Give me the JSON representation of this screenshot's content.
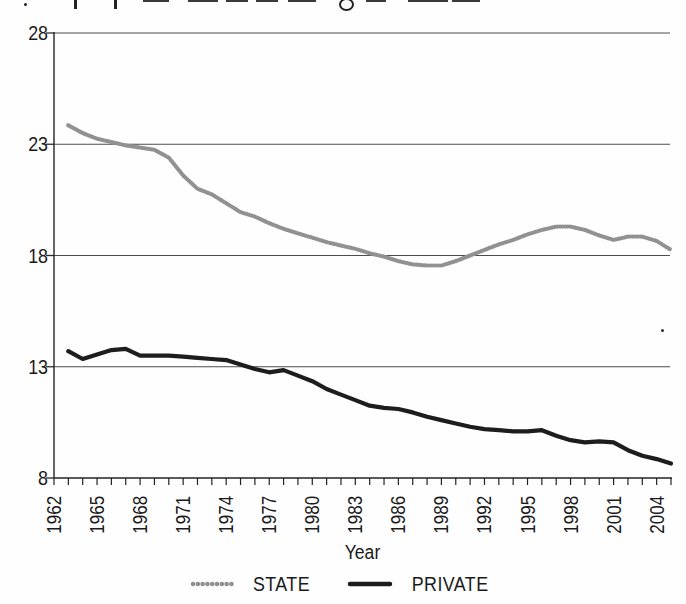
{
  "figure": {
    "background": "#fefefe",
    "cropped_caption_note": "top line of caption text is cut off by the crop; only letter bottoms/descenders are visible",
    "x_axis_title": "Year"
  },
  "scan_artifacts": {
    "cropped_text_fragments": [
      {
        "type": "dot",
        "x": 24,
        "w": 3
      },
      {
        "type": "stem",
        "x": 74,
        "w": 3
      },
      {
        "type": "stem",
        "x": 114,
        "w": 3
      },
      {
        "type": "dash",
        "x": 143,
        "w": 26
      },
      {
        "type": "dash",
        "x": 188,
        "w": 30
      },
      {
        "type": "dash",
        "x": 226,
        "w": 22
      },
      {
        "type": "dash",
        "x": 256,
        "w": 22
      },
      {
        "type": "dash",
        "x": 288,
        "w": 28
      },
      {
        "type": "loop",
        "x": 339,
        "w": 11
      },
      {
        "type": "dash",
        "x": 366,
        "w": 20
      },
      {
        "type": "dash",
        "x": 408,
        "w": 40
      },
      {
        "type": "dash",
        "x": 452,
        "w": 28
      }
    ],
    "speck": {
      "x": 661,
      "y": 329
    }
  },
  "chart_data": {
    "type": "line",
    "title": "",
    "xlabel": "Year",
    "ylabel": "",
    "xlim": [
      1962,
      2005
    ],
    "ylim": [
      8,
      28
    ],
    "y_ticks": [
      28,
      23,
      18,
      13,
      8
    ],
    "x_tick_every_year": true,
    "x_label_years": [
      1962,
      1965,
      1968,
      1971,
      1974,
      1977,
      1980,
      1983,
      1986,
      1989,
      1992,
      1995,
      1998,
      2001,
      2004
    ],
    "grid": "horizontal gridlines at 13, 18, 23, 28",
    "legend_position": "bottom-center",
    "x": [
      1963,
      1964,
      1965,
      1966,
      1967,
      1968,
      1969,
      1970,
      1971,
      1972,
      1973,
      1974,
      1975,
      1976,
      1977,
      1978,
      1979,
      1980,
      1981,
      1982,
      1983,
      1984,
      1985,
      1986,
      1987,
      1988,
      1989,
      1990,
      1991,
      1992,
      1993,
      1994,
      1995,
      1996,
      1997,
      1998,
      1999,
      2000,
      2001,
      2002,
      2003,
      2004,
      2005
    ],
    "series": [
      {
        "name": "STATE",
        "color": "#919191",
        "line_style": "thick beaded/dotted gray",
        "values": [
          23.85,
          23.5,
          23.25,
          23.1,
          22.95,
          22.85,
          22.75,
          22.4,
          21.6,
          21.0,
          20.75,
          20.35,
          19.95,
          19.75,
          19.45,
          19.2,
          19.0,
          18.8,
          18.6,
          18.45,
          18.3,
          18.1,
          17.95,
          17.75,
          17.6,
          17.55,
          17.55,
          17.75,
          18.0,
          18.25,
          18.5,
          18.7,
          18.95,
          19.15,
          19.3,
          19.3,
          19.15,
          18.9,
          18.7,
          18.85,
          18.85,
          18.65,
          18.25
        ]
      },
      {
        "name": "PRIVATE",
        "color": "#1d1d1d",
        "line_style": "thick solid black",
        "values": [
          13.7,
          13.35,
          13.55,
          13.75,
          13.8,
          13.5,
          13.5,
          13.5,
          13.45,
          13.4,
          13.35,
          13.3,
          13.1,
          12.9,
          12.75,
          12.85,
          12.6,
          12.35,
          12.0,
          11.75,
          11.5,
          11.25,
          11.15,
          11.1,
          10.95,
          10.75,
          10.6,
          10.45,
          10.3,
          10.2,
          10.15,
          10.1,
          10.1,
          10.15,
          9.9,
          9.7,
          9.6,
          9.65,
          9.6,
          9.25,
          9.0,
          8.85,
          8.65
        ]
      }
    ]
  }
}
